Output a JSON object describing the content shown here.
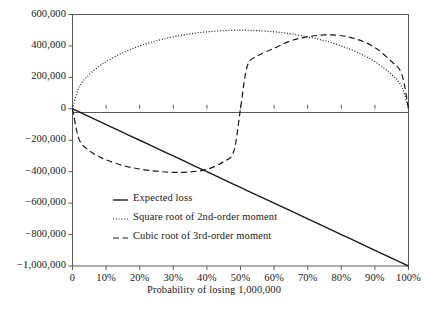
{
  "chart_data": {
    "type": "line",
    "title": "",
    "xlabel": "Probability of losing 1,000,000",
    "ylabel": "",
    "xlim": [
      0,
      1
    ],
    "ylim": [
      -1000000,
      600000
    ],
    "grid": false,
    "legend_position": "inside-lower-left",
    "x_tick_labels": [
      "0",
      "10%",
      "20%",
      "30%",
      "40%",
      "50%",
      "60%",
      "70%",
      "80%",
      "90%",
      "100%"
    ],
    "x_tick_values": [
      0,
      0.1,
      0.2,
      0.3,
      0.4,
      0.5,
      0.6,
      0.7,
      0.8,
      0.9,
      1.0
    ],
    "y_tick_labels": [
      "600,000",
      "400,000",
      "200,000",
      "0",
      "−200,000",
      "−400,000",
      "−600,000",
      "−800,000",
      "−1,000,000"
    ],
    "y_tick_values": [
      600000,
      400000,
      200000,
      0,
      -200000,
      -400000,
      -600000,
      -800000,
      -1000000
    ],
    "x": [
      0,
      0.02,
      0.05,
      0.08,
      0.1,
      0.15,
      0.2,
      0.25,
      0.3,
      0.35,
      0.4,
      0.45,
      0.48,
      0.5,
      0.52,
      0.55,
      0.6,
      0.65,
      0.7,
      0.75,
      0.8,
      0.85,
      0.9,
      0.95,
      0.98,
      1.0
    ],
    "series": [
      {
        "name": "Expected loss",
        "style": "solid",
        "color": "#1a1a1a",
        "values": [
          0,
          -20000,
          -50000,
          -80000,
          -100000,
          -150000,
          -200000,
          -250000,
          -300000,
          -350000,
          -400000,
          -450000,
          -480000,
          -500000,
          -520000,
          -550000,
          -600000,
          -650000,
          -700000,
          -750000,
          -800000,
          -850000,
          -900000,
          -950000,
          -980000,
          -1000000
        ]
      },
      {
        "name": "Square root of 2nd-order moment",
        "style": "dotted",
        "color": "#1a1a1a",
        "values": [
          0,
          140000,
          218000,
          271000,
          300000,
          357000,
          400000,
          433000,
          458000,
          477000,
          490000,
          497000,
          500000,
          500000,
          500000,
          497000,
          490000,
          477000,
          458000,
          433000,
          400000,
          357000,
          300000,
          218000,
          140000,
          0
        ]
      },
      {
        "name": "Cubic root of 3rd-order moment",
        "style": "dashed",
        "color": "#1a1a1a",
        "values": [
          0,
          -196000,
          -266000,
          -305000,
          -325000,
          -361000,
          -383000,
          -397000,
          -404000,
          -401000,
          -385000,
          -336000,
          -271000,
          0,
          271000,
          336000,
          385000,
          433000,
          458000,
          470000,
          465000,
          440000,
          390000,
          300000,
          220000,
          0
        ]
      }
    ],
    "legend": [
      {
        "label": "Expected loss",
        "style": "solid"
      },
      {
        "label": "Square root of 2nd-order moment",
        "style": "dotted"
      },
      {
        "label": "Cubic root of 3rd-order moment",
        "style": "dashed"
      }
    ]
  }
}
